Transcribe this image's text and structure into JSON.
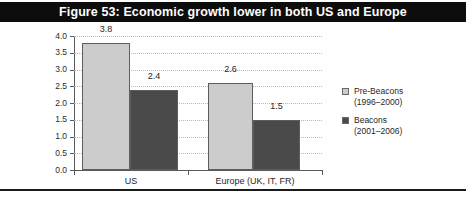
{
  "figure": {
    "title": "Figure 53: Economic growth lower in both US and Europe",
    "title_bar_color": "#0d0d0d",
    "title_text_color": "#ffffff"
  },
  "colors": {
    "series_light": "#cccccc",
    "series_dark": "#4a4a4a",
    "axis": "#5a5a5a",
    "gridline": "#b8b8b8",
    "text": "#1f1f1f"
  },
  "axis": {
    "y_label": "% Real GDP",
    "y_ticks": [
      "4.0",
      "3.5",
      "3.0",
      "2.5",
      "2.0",
      "1.5",
      "1.0",
      "0.5",
      "0.0"
    ]
  },
  "legend": [
    {
      "name": "Pre-Beacons",
      "period": "(1996–2000)",
      "swatch": "light"
    },
    {
      "name": "Beacons",
      "period": "(2001–2006)",
      "swatch": "dark"
    }
  ],
  "bars": [
    {
      "label": "3.8",
      "value": 3.8
    },
    {
      "label": "2.4",
      "value": 2.4
    },
    {
      "label": "2.6",
      "value": 2.6
    },
    {
      "label": "1.5",
      "value": 1.5
    }
  ],
  "categories": [
    "US",
    "Europe (UK, IT, FR)"
  ],
  "chart_data": {
    "type": "bar",
    "title": "Figure 53: Economic growth lower in both US and Europe",
    "xlabel": "",
    "ylabel": "% Real GDP",
    "ylim": [
      0.0,
      4.0
    ],
    "ytick_step": 0.5,
    "yticks": [
      0.0,
      0.5,
      1.0,
      1.5,
      2.0,
      2.5,
      3.0,
      3.5,
      4.0
    ],
    "grid": true,
    "grid_axis": "y",
    "legend_position": "right",
    "categories": [
      "US",
      "Europe (UK, IT, FR)"
    ],
    "series": [
      {
        "name": "Pre-Beacons (1996–2000)",
        "values": [
          3.8,
          2.6
        ],
        "color": "#cccccc",
        "data_labels": [
          "3.8",
          "2.6"
        ]
      },
      {
        "name": "Beacons (2001–2006)",
        "values": [
          2.4,
          1.5
        ],
        "color": "#4a4a4a",
        "data_labels": [
          "2.4",
          "1.5"
        ]
      }
    ]
  }
}
